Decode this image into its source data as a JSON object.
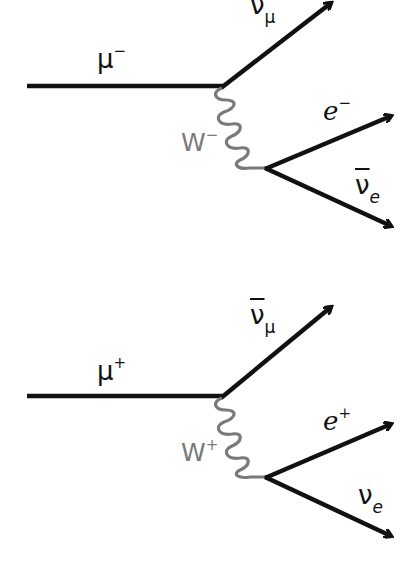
{
  "diagrams": [
    {
      "name": "muon-minus-decay",
      "incoming": {
        "symbol": "μ",
        "charge": "−"
      },
      "boson": {
        "symbol": "W",
        "charge": "−"
      },
      "outgoing_vertex1": {
        "symbol": "ν",
        "subscript": "μ",
        "bar": false
      },
      "outgoing_vertex2a": {
        "symbol": "e",
        "charge": "−"
      },
      "outgoing_vertex2b": {
        "symbol": "ν",
        "subscript": "e",
        "bar": true
      }
    },
    {
      "name": "muon-plus-decay",
      "incoming": {
        "symbol": "μ",
        "charge": "+"
      },
      "boson": {
        "symbol": "W",
        "charge": "+"
      },
      "outgoing_vertex1": {
        "symbol": "ν",
        "subscript": "μ",
        "bar": true
      },
      "outgoing_vertex2a": {
        "symbol": "e",
        "charge": "+"
      },
      "outgoing_vertex2b": {
        "symbol": "ν",
        "subscript": "e",
        "bar": false
      }
    }
  ],
  "colors": {
    "fermion_line": "#111111",
    "boson_line": "#7a7a7a",
    "background": "#ffffff"
  }
}
